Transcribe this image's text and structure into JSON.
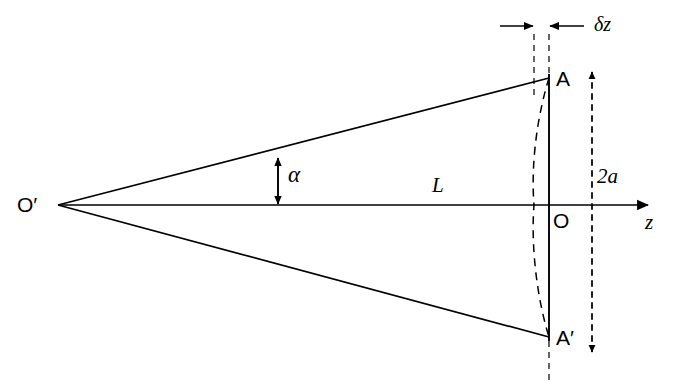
{
  "figure": {
    "type": "optics-ray-diagram",
    "background_color": "#ffffff",
    "line_color": "#000000"
  },
  "labels": {
    "source_point": "O",
    "source_point_prime": "′",
    "focus_point": "O",
    "aperture_top": "A",
    "aperture_bottom": "A",
    "aperture_bottom_prime": "′",
    "axis": "z",
    "distance": "L",
    "aperture_size": "2a",
    "angle": "α",
    "defocus": "δz"
  },
  "geometry": {
    "origin_left": {
      "x": 58,
      "y": 205
    },
    "origin_right": {
      "x": 549,
      "y": 205
    },
    "point_a": {
      "x": 549,
      "y": 78
    },
    "point_a_prime": {
      "x": 549,
      "y": 337
    },
    "axis_arrow_end": {
      "x": 652,
      "y": 205
    },
    "arc_apex_x": 534,
    "aperture_dim_x": 592,
    "defocus_dim_y": 26,
    "alpha_arrow_x": 278
  },
  "elements": {
    "upper_ray": "upper-ray",
    "lower_ray": "lower-ray",
    "optical_axis": "optical-axis",
    "focal_plane_line": "focal-plane-line",
    "wavefront_arc": "wavefront-arc",
    "defocus_guide_left": "defocus-guide-left",
    "defocus_guide_right": "defocus-guide-right",
    "aperture_dimension": "aperture-dimension",
    "defocus_dimension": "defocus-dimension",
    "angle_dimension": "angle-dimension"
  }
}
